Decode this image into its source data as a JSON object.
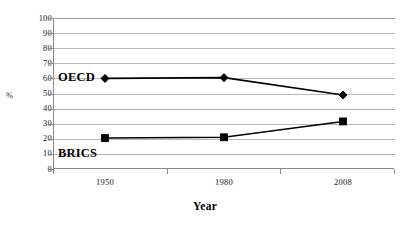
{
  "chart_data": {
    "type": "line",
    "title": "",
    "subtitle": "",
    "xlabel": "Year",
    "ylabel": "%",
    "categories": [
      "1950",
      "1980",
      "2008"
    ],
    "x": [
      1950,
      1980,
      2008
    ],
    "ylim": [
      0,
      100
    ],
    "y_ticks": [
      0,
      10,
      20,
      30,
      40,
      50,
      60,
      70,
      80,
      90,
      100
    ],
    "y_tick_labels": [
      "0",
      "10",
      "20",
      "30",
      "40",
      "50",
      "60",
      "70",
      "80",
      "90",
      "100"
    ],
    "grid": "horizontal",
    "legend_position": "inline-labels",
    "series": [
      {
        "name": "OECD",
        "marker": "diamond",
        "color": "#000000",
        "values": [
          60,
          60.5,
          49
        ]
      },
      {
        "name": "BRICS",
        "marker": "square",
        "color": "#000000",
        "values": [
          20.5,
          21,
          31.5
        ]
      }
    ],
    "annotations": [
      {
        "text": "OECD",
        "series": "OECD"
      },
      {
        "text": "BRICS",
        "series": "BRICS"
      }
    ]
  },
  "axis": {
    "y_title": "%",
    "x_title": "Year"
  },
  "colors": {
    "line": "#000000",
    "gridline": "#b9b9b9",
    "axis": "#8a8a8a",
    "background": "#ffffff"
  }
}
